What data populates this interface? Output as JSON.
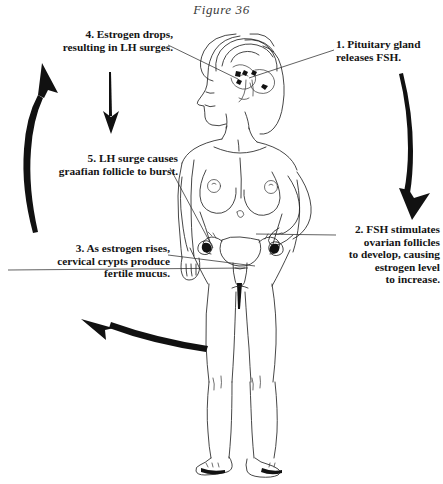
{
  "figure": {
    "caption": "Figure 36"
  },
  "annotations": [
    {
      "id": "label-1",
      "number": "1.",
      "text": "1.  Pituitary gland\nreleases FSH.",
      "align": "right",
      "points_to": "pituitary-gland"
    },
    {
      "id": "label-2",
      "number": "2.",
      "text": "2.  FSH stimulates\novarian follicles\nto develop, causing\nestrogen level\nto increase.",
      "align": "right",
      "points_to": "right-ovary"
    },
    {
      "id": "label-3",
      "number": "3.",
      "text": "3.  As estrogen rises,\ncervical crypts produce\nfertile mucus.",
      "align": "right",
      "points_to": "cervix"
    },
    {
      "id": "label-4",
      "number": "4.",
      "text": "4.  Estrogen drops,\nresulting in LH surges.",
      "align": "right",
      "points_to": "pituitary-gland"
    },
    {
      "id": "label-5",
      "number": "5.",
      "text": "5.  LH surge causes\ngraafian follicle to burst.",
      "align": "right",
      "points_to": "left-ovary"
    }
  ],
  "flow_arrows": [
    {
      "id": "arrow-left-up",
      "direction": "up",
      "description": "thick curved arrow on left side pointing up"
    },
    {
      "id": "arrow-down-small",
      "direction": "down",
      "description": "thin straight arrow pointing down below label 4"
    },
    {
      "id": "arrow-right-down",
      "direction": "down",
      "description": "thick curved arrow on right side pointing down"
    },
    {
      "id": "arrow-bottom-left",
      "direction": "up-left",
      "description": "thick curved arrow along bottom pointing up-left"
    }
  ],
  "colors": {
    "ink": "#262626",
    "arrow": "#111111",
    "background": "#ffffff",
    "caption": "#3a3a3a"
  }
}
